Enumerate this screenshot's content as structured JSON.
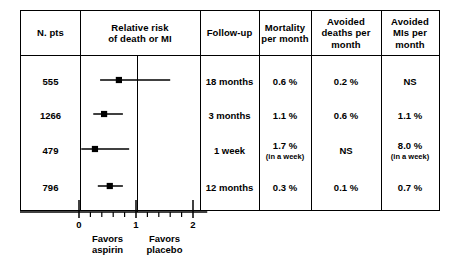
{
  "figure": {
    "type": "forest-plot-table",
    "background": "#ffffff",
    "ink": "#000000"
  },
  "table": {
    "columns": [
      {
        "key": "n_pts",
        "header": "N. pts"
      },
      {
        "key": "relative_risk",
        "header": "Relative risk\nof death or MI",
        "header_line1": "Relative risk",
        "header_line2": "of death or MI"
      },
      {
        "key": "follow_up",
        "header": "Follow-up"
      },
      {
        "key": "mortality",
        "header_line1": "Mortality",
        "header_line2": "per month"
      },
      {
        "key": "avoided_deaths",
        "header_line1": "Avoided",
        "header_line2": "deaths per",
        "header_line3": "month"
      },
      {
        "key": "avoided_mis",
        "header_line1": "Avoided",
        "header_line2": "MIs per",
        "header_line3": "month"
      }
    ],
    "rows": [
      {
        "n_pts": "555",
        "follow_up": "18 months",
        "mortality": "0.6 %",
        "mortality_sub": "",
        "avoided_deaths": "0.2 %",
        "avoided_deaths_sub": "",
        "avoided_mis": "NS",
        "avoided_mis_sub": ""
      },
      {
        "n_pts": "1266",
        "follow_up": "3 months",
        "mortality": "1.1 %",
        "mortality_sub": "",
        "avoided_deaths": "0.6 %",
        "avoided_deaths_sub": "",
        "avoided_mis": "1.1 %",
        "avoided_mis_sub": ""
      },
      {
        "n_pts": "479",
        "follow_up": "1 week",
        "mortality": "1.7 %",
        "mortality_sub": "(in a week)",
        "avoided_deaths": "NS",
        "avoided_deaths_sub": "",
        "avoided_mis": "8.0 %",
        "avoided_mis_sub": "(in a week)"
      },
      {
        "n_pts": "796",
        "follow_up": "12 months",
        "mortality": "0.3 %",
        "mortality_sub": "",
        "avoided_deaths": "0.1 %",
        "avoided_deaths_sub": "",
        "avoided_mis": "0.7 %",
        "avoided_mis_sub": ""
      }
    ]
  },
  "chart_data": {
    "type": "forest",
    "title": "Relative risk of death or MI",
    "xlabel": "Relative risk",
    "ylabel": "",
    "xlim": [
      0,
      2
    ],
    "reference_line": 1,
    "major_ticks": [
      0,
      1,
      2
    ],
    "major_tick_labels": [
      "0",
      "1",
      "2"
    ],
    "minor_tick_step": 0.2,
    "grid": false,
    "marker": "filled-square",
    "marker_color": "#000000",
    "line_color": "#000000",
    "categories": [
      "555",
      "1266",
      "479",
      "796"
    ],
    "series": [
      {
        "name": "Relative risk of death or MI",
        "points": [
          {
            "label": "555",
            "estimate": 0.7,
            "ci_low": 0.37,
            "ci_high": 1.6
          },
          {
            "label": "1266",
            "estimate": 0.44,
            "ci_low": 0.25,
            "ci_high": 0.77
          },
          {
            "label": "479",
            "estimate": 0.28,
            "ci_low": 0.04,
            "ci_high": 0.88
          },
          {
            "label": "796",
            "estimate": 0.54,
            "ci_low": 0.33,
            "ci_high": 0.77
          }
        ]
      }
    ],
    "annotations": {
      "left_caption_line1": "Favors",
      "left_caption_line2": "aspirin",
      "left_caption_at_x": 0.5,
      "right_caption_line1": "Favors",
      "right_caption_line2": "placebo",
      "right_caption_at_x": 1.5
    }
  },
  "axis": {
    "ticks": [
      {
        "value": "0",
        "x": 0
      },
      {
        "value": "1",
        "x": 1
      },
      {
        "value": "2",
        "x": 2
      }
    ],
    "favors_aspirin_line1": "Favors",
    "favors_aspirin_line2": "aspirin",
    "favors_placebo_line1": "Favors",
    "favors_placebo_line2": "placebo"
  }
}
